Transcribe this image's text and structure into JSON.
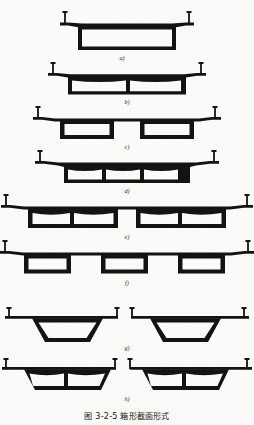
{
  "figure": {
    "caption_number": "图 3-2-5",
    "caption_title": "箱形截面形式",
    "caption_full": "图 3-2-5    箱形截面形式",
    "background_color": "#fbfaf8",
    "ink_color": "#151311",
    "total_sections": 8
  },
  "sections": [
    {
      "key": "a",
      "label": "a)",
      "description": "single-cell box girder with cantilever flanges",
      "cells": 1,
      "boxes": 1,
      "web_type": "vertical",
      "soffit": "flat",
      "railing_posts": 2,
      "center_posts": 0
    },
    {
      "key": "b",
      "label": "b)",
      "description": "two-cell box girder with arched voids",
      "cells": 2,
      "boxes": 1,
      "web_type": "vertical",
      "soffit": "arched",
      "railing_posts": 2,
      "center_posts": 0
    },
    {
      "key": "c",
      "label": "c)",
      "description": "twin separate single-cell boxes under common deck",
      "cells": 2,
      "boxes": 2,
      "web_type": "vertical",
      "soffit": "flat",
      "railing_posts": 2,
      "center_posts": 0
    },
    {
      "key": "d",
      "label": "d)",
      "description": "three-cell box girder with arched voids",
      "cells": 3,
      "boxes": 1,
      "web_type": "vertical",
      "soffit": "arched",
      "railing_posts": 2,
      "center_posts": 0
    },
    {
      "key": "e",
      "label": "e)",
      "description": "two twin-cell boxes under common wide deck",
      "cells": 4,
      "boxes": 2,
      "web_type": "vertical",
      "soffit": "arched",
      "railing_posts": 2,
      "center_posts": 0
    },
    {
      "key": "f",
      "label": "f)",
      "description": "three separate single-cell boxes under common wide deck",
      "cells": 3,
      "boxes": 3,
      "web_type": "vertical",
      "soffit": "flat",
      "railing_posts": 2,
      "center_posts": 0
    },
    {
      "key": "g",
      "label": "g)",
      "description": "divided deck, two trapezoidal single-cell boxes with median posts",
      "cells": 2,
      "boxes": 2,
      "web_type": "sloping",
      "soffit": "flat",
      "railing_posts": 2,
      "center_posts": 2
    },
    {
      "key": "h",
      "label": "h)",
      "description": "divided deck, two trapezoidal twin-cell boxes with median posts",
      "cells": 4,
      "boxes": 2,
      "web_type": "sloping",
      "soffit": "arched",
      "railing_posts": 2,
      "center_posts": 2
    }
  ]
}
